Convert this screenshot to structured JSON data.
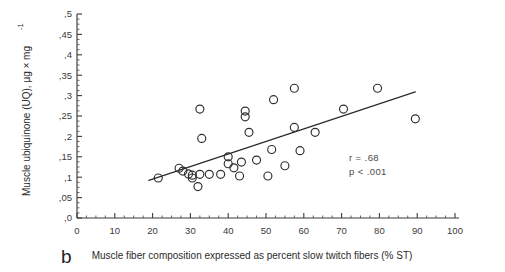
{
  "figure": {
    "panel_letter": "b",
    "ylabel": "Muscle ubiquinone (UQ), µg × mg",
    "ylabel_exponent": "-1",
    "xlabel": "Muscle fiber composition expressed as percent slow twitch fibers (% ST)",
    "stats_r": "r = .68",
    "stats_p": "p < .001",
    "colors": {
      "axis": "#3a3a3a",
      "marker": "#2f2f2f",
      "regression_line": "#2b2b2b",
      "text": "#2b2b2b",
      "background": "#ffffff"
    }
  },
  "chart_data": {
    "type": "scatter",
    "title": "",
    "xlabel": "Muscle fiber composition expressed as percent slow twitch fibers (% ST)",
    "ylabel": "Muscle ubiquinone (UQ), µg × mg-1",
    "xlim": [
      0,
      100
    ],
    "ylim": [
      0,
      0.5
    ],
    "grid": false,
    "legend": null,
    "xticks": [
      0,
      10,
      20,
      30,
      40,
      50,
      60,
      70,
      80,
      90,
      100
    ],
    "xticklabels": [
      "0",
      "10",
      "20",
      "30",
      "40",
      "50",
      "60",
      "70",
      "80",
      "90",
      "100"
    ],
    "yticks": [
      0,
      0.05,
      0.1,
      0.15,
      0.2,
      0.25,
      0.3,
      0.35,
      0.4,
      0.45,
      0.5
    ],
    "yticklabels": [
      ",0",
      ",05",
      ",1",
      ",15",
      ",2",
      ",25",
      ",3",
      ",35",
      ",4",
      ",45",
      ",5"
    ],
    "x_minor_step": 2.5,
    "y_minor_step": 0.0125,
    "marker": "open-circle",
    "annotations": [
      {
        "text": "r = .68",
        "x": 72,
        "y": 0.115
      },
      {
        "text": "p < .001",
        "x": 72,
        "y": 0.093
      }
    ],
    "regression_line": {
      "x": [
        19,
        89.5
      ],
      "y": [
        0.092,
        0.309
      ]
    },
    "points": [
      {
        "x": 21.5,
        "y": 0.098
      },
      {
        "x": 27.0,
        "y": 0.122
      },
      {
        "x": 28.0,
        "y": 0.115
      },
      {
        "x": 29.5,
        "y": 0.108
      },
      {
        "x": 30.5,
        "y": 0.105
      },
      {
        "x": 30.5,
        "y": 0.098
      },
      {
        "x": 32.5,
        "y": 0.107
      },
      {
        "x": 32.0,
        "y": 0.077
      },
      {
        "x": 33.0,
        "y": 0.195
      },
      {
        "x": 32.5,
        "y": 0.267
      },
      {
        "x": 35.0,
        "y": 0.107
      },
      {
        "x": 38.0,
        "y": 0.107
      },
      {
        "x": 40.0,
        "y": 0.15
      },
      {
        "x": 40.0,
        "y": 0.133
      },
      {
        "x": 41.5,
        "y": 0.123
      },
      {
        "x": 43.5,
        "y": 0.137
      },
      {
        "x": 43.0,
        "y": 0.103
      },
      {
        "x": 44.5,
        "y": 0.262
      },
      {
        "x": 44.5,
        "y": 0.248
      },
      {
        "x": 45.5,
        "y": 0.21
      },
      {
        "x": 47.5,
        "y": 0.142
      },
      {
        "x": 50.5,
        "y": 0.103
      },
      {
        "x": 51.5,
        "y": 0.168
      },
      {
        "x": 52.0,
        "y": 0.29
      },
      {
        "x": 55.0,
        "y": 0.128
      },
      {
        "x": 57.5,
        "y": 0.318
      },
      {
        "x": 57.5,
        "y": 0.222
      },
      {
        "x": 59.0,
        "y": 0.165
      },
      {
        "x": 63.0,
        "y": 0.21
      },
      {
        "x": 70.5,
        "y": 0.267
      },
      {
        "x": 79.5,
        "y": 0.318
      },
      {
        "x": 89.5,
        "y": 0.243
      }
    ]
  }
}
